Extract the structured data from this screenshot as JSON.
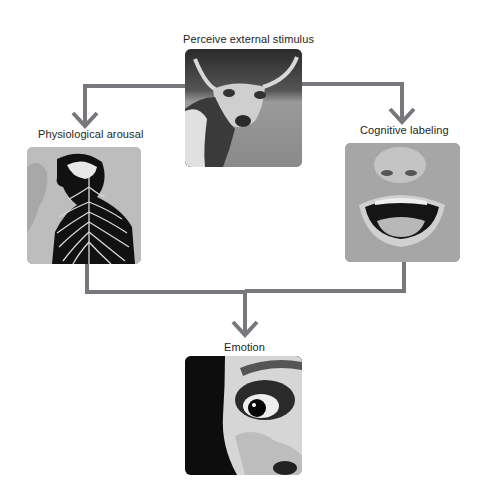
{
  "diagram": {
    "type": "flowchart",
    "nodes": [
      {
        "id": "stimulus",
        "label": "Perceive external stimulus",
        "image": "longhorn-bull-photo"
      },
      {
        "id": "arousal",
        "label": "Physiological arousal",
        "image": "nervous-system-illustration"
      },
      {
        "id": "labeling",
        "label": "Cognitive labeling",
        "image": "open-mouth-face-photo"
      },
      {
        "id": "emotion",
        "label": "Emotion",
        "image": "frightened-eye-photo"
      }
    ],
    "edges": [
      {
        "from": "stimulus",
        "to": "arousal"
      },
      {
        "from": "stimulus",
        "to": "labeling"
      },
      {
        "from": "arousal",
        "to": "emotion"
      },
      {
        "from": "labeling",
        "to": "emotion"
      }
    ],
    "colors": {
      "connector": "#77787b",
      "text": "#231f20",
      "background": "#ffffff"
    }
  }
}
